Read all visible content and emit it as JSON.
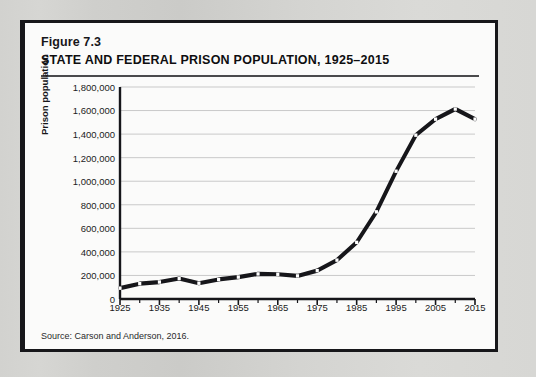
{
  "figure": {
    "label": "Figure 7.3",
    "title": "STATE AND FEDERAL PRISON POPULATION, 1925–2015",
    "source": "Source:  Carson and Anderson, 2016."
  },
  "colors": {
    "page_background": "#d9d9d6",
    "figure_background": "#fbfbfa",
    "figure_border": "#17171a",
    "line": "#16161a",
    "marker_fill": "#ffffff",
    "gridline": "#c9c9c9",
    "axis": "#16161a",
    "text": "#1b1b1d"
  },
  "chart_data": {
    "type": "line",
    "title": "STATE AND FEDERAL PRISON POPULATION, 1925–2015",
    "xlabel": "",
    "ylabel": "Prison population",
    "xlim": [
      1925,
      2015
    ],
    "ylim": [
      0,
      1800000
    ],
    "ytick_step": 200000,
    "xtick_step": 10,
    "x_minor_tick_step": 5,
    "grid": "horizontal",
    "legend": "none",
    "marker": "white-square",
    "ytick_labels": [
      "0",
      "200,000",
      "400,000",
      "600,000",
      "800,000",
      "1,000,000",
      "1,200,000",
      "1,400,000",
      "1,600,000",
      "1,800,000"
    ],
    "ytick_values": [
      0,
      200000,
      400000,
      600000,
      800000,
      1000000,
      1200000,
      1400000,
      1600000,
      1800000
    ],
    "xtick_labels": [
      "1925",
      "1935",
      "1945",
      "1955",
      "1965",
      "1975",
      "1985",
      "1995",
      "2005",
      "2015"
    ],
    "xtick_values": [
      1925,
      1935,
      1945,
      1955,
      1965,
      1975,
      1985,
      1995,
      2005,
      2015
    ],
    "x": [
      1925,
      1930,
      1935,
      1940,
      1945,
      1950,
      1955,
      1960,
      1965,
      1970,
      1975,
      1980,
      1985,
      1990,
      1995,
      2000,
      2005,
      2010,
      2015
    ],
    "values": [
      92000,
      130000,
      144000,
      174000,
      134000,
      166000,
      186000,
      213000,
      210000,
      196000,
      241000,
      330000,
      481000,
      740000,
      1085000,
      1391000,
      1527000,
      1613000,
      1527000
    ],
    "series": [
      {
        "name": "State and federal prison population",
        "values": [
          92000,
          130000,
          144000,
          174000,
          134000,
          166000,
          186000,
          213000,
          210000,
          196000,
          241000,
          330000,
          481000,
          740000,
          1085000,
          1391000,
          1527000,
          1613000,
          1527000
        ]
      }
    ]
  }
}
